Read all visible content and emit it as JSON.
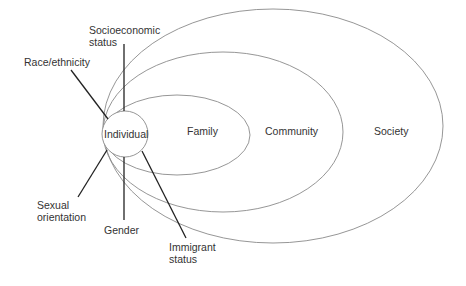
{
  "diagram": {
    "colors": {
      "ellipse_stroke": "#8a8a8a",
      "line_stroke": "#222222",
      "text": "#333333",
      "background": "#ffffff"
    },
    "layers": [
      {
        "id": "individual",
        "label": "Individual"
      },
      {
        "id": "family",
        "label": "Family"
      },
      {
        "id": "community",
        "label": "Community"
      },
      {
        "id": "society",
        "label": "Society"
      }
    ],
    "factors": [
      {
        "id": "socioeconomic",
        "line1": "Socioeconomic",
        "line2": "status"
      },
      {
        "id": "race",
        "line1": "Race/ethnicity"
      },
      {
        "id": "sexual-orientation",
        "line1": "Sexual",
        "line2": "orientation"
      },
      {
        "id": "gender",
        "line1": "Gender"
      },
      {
        "id": "immigrant",
        "line1": "Immigrant",
        "line2": "status"
      }
    ]
  }
}
